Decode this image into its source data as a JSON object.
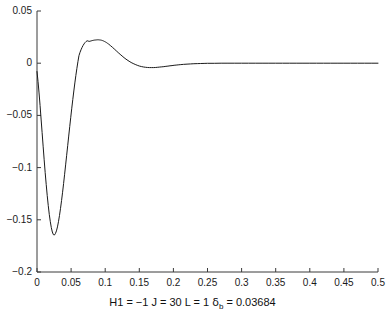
{
  "chart_data": {
    "type": "line",
    "title": "",
    "subtitle": "",
    "xlabel": "H1 = −1 J = 30 L = 1 δ_b = 0.03684",
    "ylabel": "",
    "xlim": [
      0,
      0.5
    ],
    "ylim": [
      -0.2,
      0.05
    ],
    "grid": false,
    "legend": null,
    "legend_position": "none",
    "xticks": [
      0,
      0.05,
      0.1,
      0.15,
      0.2,
      0.25,
      0.3,
      0.35,
      0.4,
      0.45,
      0.5
    ],
    "xtick_labels": [
      "0",
      "0.05",
      "0.1",
      "0.15",
      "0.2",
      "0.25",
      "0.3",
      "0.35",
      "0.4",
      "0.45",
      "0.5"
    ],
    "yticks": [
      0.05,
      0,
      -0.05,
      -0.1,
      -0.15,
      -0.2
    ],
    "ytick_labels": [
      "0.05",
      "0",
      "−0.05",
      "−0.1",
      "−0.15",
      "−0.2"
    ],
    "line_color": "#1a1a1a",
    "line_width": 1,
    "series": [
      {
        "name": "response",
        "x": [
          0,
          0.0015,
          0.003,
          0.0045,
          0.006,
          0.0075,
          0.009,
          0.0105,
          0.012,
          0.0135,
          0.015,
          0.0165,
          0.018,
          0.0195,
          0.021,
          0.0225,
          0.024,
          0.0255,
          0.027,
          0.0285,
          0.03,
          0.0315,
          0.033,
          0.0345,
          0.036,
          0.0375,
          0.039,
          0.0405,
          0.042,
          0.0435,
          0.045,
          0.0465,
          0.048,
          0.0495,
          0.051,
          0.0525,
          0.054,
          0.0555,
          0.057,
          0.0585,
          0.06,
          0.0615,
          0.063,
          0.0645,
          0.066,
          0.0675,
          0.069,
          0.0705,
          0.072,
          0.0735,
          0.075,
          0.0765,
          0.078,
          0.0795,
          0.081,
          0.0825,
          0.084,
          0.0855,
          0.087,
          0.0885,
          0.09,
          0.0915,
          0.093,
          0.0945,
          0.096,
          0.0975,
          0.099,
          0.1005,
          0.102,
          0.1035,
          0.105,
          0.108,
          0.111,
          0.114,
          0.117,
          0.12,
          0.123,
          0.126,
          0.129,
          0.132,
          0.135,
          0.138,
          0.141,
          0.144,
          0.147,
          0.15,
          0.153,
          0.156,
          0.159,
          0.162,
          0.165,
          0.168,
          0.171,
          0.174,
          0.177,
          0.18,
          0.183,
          0.186,
          0.189,
          0.192,
          0.195,
          0.198,
          0.201,
          0.204,
          0.207,
          0.21,
          0.215,
          0.22,
          0.225,
          0.23,
          0.235,
          0.24,
          0.245,
          0.25,
          0.26,
          0.27,
          0.28,
          0.29,
          0.3,
          0.31,
          0.32,
          0.33,
          0.34,
          0.35,
          0.36,
          0.37,
          0.38,
          0.39,
          0.4,
          0.41,
          0.42,
          0.43,
          0.44,
          0.45,
          0.46,
          0.47,
          0.48,
          0.49,
          0.5
        ],
        "y": [
          -0.008,
          -0.0175,
          -0.0285,
          -0.0405,
          -0.0535,
          -0.0665,
          -0.0795,
          -0.0925,
          -0.1048,
          -0.1162,
          -0.1268,
          -0.1364,
          -0.1448,
          -0.1518,
          -0.1575,
          -0.1617,
          -0.1642,
          -0.1646,
          -0.1632,
          -0.1606,
          -0.1568,
          -0.1518,
          -0.1458,
          -0.139,
          -0.1316,
          -0.1236,
          -0.1152,
          -0.1064,
          -0.0974,
          -0.0882,
          -0.079,
          -0.0698,
          -0.0607,
          -0.0518,
          -0.0431,
          -0.0347,
          -0.0266,
          -0.0189,
          -0.0117,
          -0.0049,
          0.0014,
          0.0072,
          0.0103,
          0.0128,
          0.015,
          0.0169,
          0.0185,
          0.0198,
          0.0208,
          0.0215,
          0.0212,
          0.0209,
          0.0211,
          0.0214,
          0.0217,
          0.0219,
          0.0221,
          0.0222,
          0.0223,
          0.0224,
          0.0224,
          0.0223,
          0.0222,
          0.022,
          0.0217,
          0.0213,
          0.0208,
          0.0203,
          0.0197,
          0.019,
          0.0183,
          0.0167,
          0.015,
          0.0132,
          0.0114,
          0.0096,
          0.0079,
          0.0062,
          0.0046,
          0.0032,
          0.0019,
          0.0007,
          -0.0003,
          -0.0012,
          -0.002,
          -0.0027,
          -0.0032,
          -0.0036,
          -0.0039,
          -0.0041,
          -0.0042,
          -0.0042,
          -0.0042,
          -0.0041,
          -0.0039,
          -0.0037,
          -0.0035,
          -0.0033,
          -0.003,
          -0.0028,
          -0.0025,
          -0.0023,
          -0.002,
          -0.0018,
          -0.0016,
          -0.0014,
          -0.0011,
          -0.0009,
          -0.0007,
          -0.0005,
          -0.0004,
          -0.0003,
          -0.0002,
          -0.0001,
          -0.0001,
          0.0,
          0.0,
          0.0,
          0.0,
          0.0,
          0.0,
          0.0,
          0.0,
          0.0,
          0.0,
          0.0,
          0.0,
          0.0,
          0.0,
          0.0,
          0.0,
          0.0,
          0.0,
          0.0,
          0.0,
          0.0,
          0.0,
          0.0,
          0.0
        ]
      }
    ],
    "annotations": {
      "H1": "−1",
      "J": "30",
      "L": "1",
      "delta_b": "0.03684"
    }
  },
  "xlabel_parts": {
    "prefix": "H1 = −1 J = 30 L = 1 ",
    "symbol": "δ",
    "subscript": "b",
    "suffix": " = 0.03684"
  }
}
